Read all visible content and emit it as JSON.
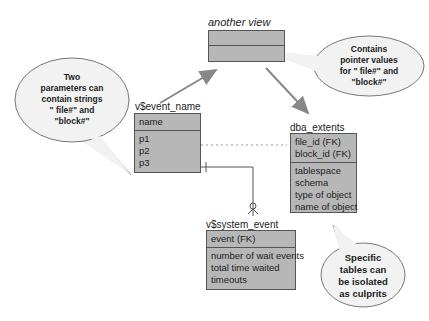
{
  "entities": {
    "another_view": {
      "title": "another view"
    },
    "event_name": {
      "title": "v$event_name",
      "keys": [
        "name"
      ],
      "attributes": [
        "p1",
        "p2",
        "p3"
      ]
    },
    "dba_extents": {
      "title": "dba_extents",
      "keys": [
        "file_id (FK)",
        "block_id (FK)"
      ],
      "attributes": [
        "tablespace",
        "schema",
        "type of object",
        "name of object"
      ]
    },
    "system_event": {
      "title": "v$system_event",
      "keys": [
        "event (FK)"
      ],
      "attributes": [
        "number of wait events",
        "total time waited",
        "timeouts"
      ]
    }
  },
  "callouts": {
    "left": [
      "Two",
      "parameters can",
      "contain strings",
      "\" file#\" and",
      "\"block#\""
    ],
    "top_right": [
      "Contains",
      "pointer values",
      "for \" file#\" and",
      "\"block#\""
    ],
    "bottom_right": [
      "Specific",
      "tables can",
      "be isolated",
      "as culprits"
    ]
  },
  "colors": {
    "entity_fill": "#b7b7b7",
    "entity_border": "#555555",
    "callout_fill": "#f2f2f2",
    "arrow": "#888888"
  }
}
